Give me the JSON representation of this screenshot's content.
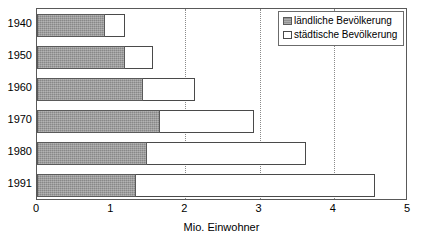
{
  "chart_data": {
    "type": "bar",
    "orientation": "horizontal",
    "stacked": true,
    "title": "",
    "xlabel": "Mio. Einwohner",
    "ylabel": "",
    "xlim": [
      0,
      5
    ],
    "xticks": [
      "0",
      "1",
      "2",
      "3",
      "4",
      "5"
    ],
    "xtick_values": [
      0,
      1,
      2,
      3,
      4,
      5
    ],
    "gridlines": {
      "vertical_at": [
        2,
        3,
        4
      ],
      "style": "dotted",
      "horizontal": false
    },
    "legend": {
      "position": "top-right",
      "entries": [
        {
          "label": "ländliche Bevölkerung",
          "swatch": "gray-hatched"
        },
        {
          "label": "städtische Bevölkerung",
          "swatch": "white-outline"
        }
      ]
    },
    "categories": [
      "1940",
      "1950",
      "1960",
      "1970",
      "1980",
      "1991"
    ],
    "series": [
      {
        "name": "ländliche Bevölkerung",
        "values": [
          0.92,
          1.19,
          1.43,
          1.66,
          1.48,
          1.34
        ]
      },
      {
        "name": "städtische Bevölkerung",
        "values": [
          0.27,
          0.38,
          0.7,
          1.26,
          2.14,
          3.22
        ]
      }
    ],
    "totals": [
      1.19,
      1.57,
      2.13,
      2.92,
      3.62,
      4.56
    ]
  }
}
